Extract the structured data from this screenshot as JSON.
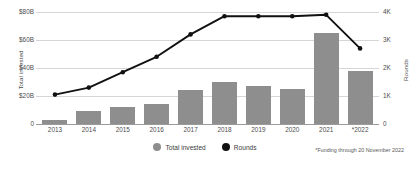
{
  "chart_data": {
    "type": "bar",
    "title": "",
    "subtitle": "",
    "xlabel": "",
    "ylabel": "Total invested",
    "y2label": "Rounds",
    "grid": true,
    "legend_position": "bottom-center",
    "categories": [
      "2013",
      "2014",
      "2015",
      "2016",
      "2017",
      "2018",
      "2019",
      "2020",
      "2021",
      "*2022"
    ],
    "axes": {
      "left": {
        "label": "Total invested",
        "ylim": [
          0,
          80
        ],
        "unit": "B USD",
        "ticks": [
          0,
          20,
          40,
          60,
          80
        ],
        "tick_labels": [
          "0",
          "$20B",
          "$40B",
          "$60B",
          "$80B"
        ]
      },
      "right": {
        "label": "Rounds",
        "ylim": [
          0,
          4000
        ],
        "ticks": [
          0,
          1000,
          2000,
          3000,
          4000
        ],
        "tick_labels": [
          "0",
          "1K",
          "2K",
          "3K",
          "4K"
        ]
      }
    },
    "series": [
      {
        "name": "Total invested",
        "type": "bar",
        "axis": "left",
        "color": "#8e8e8e",
        "unit": "B USD",
        "values": [
          3,
          9,
          12,
          14,
          24,
          30,
          27,
          25,
          65,
          38
        ]
      },
      {
        "name": "Rounds",
        "type": "line",
        "axis": "right",
        "color": "#111111",
        "marker": "circle",
        "values": [
          1050,
          1300,
          1850,
          2400,
          3200,
          3850,
          3850,
          3850,
          3900,
          2700
        ]
      }
    ],
    "annotations": [
      "*Funding through 20 November 2022"
    ]
  },
  "legend": {
    "items": [
      {
        "label": "Total invested",
        "color": "#8e8e8e",
        "marker": "circle-gray"
      },
      {
        "label": "Rounds",
        "color": "#111111",
        "marker": "circle-black"
      }
    ]
  },
  "footnote": {
    "text": "*Funding through 20 November 2022"
  }
}
